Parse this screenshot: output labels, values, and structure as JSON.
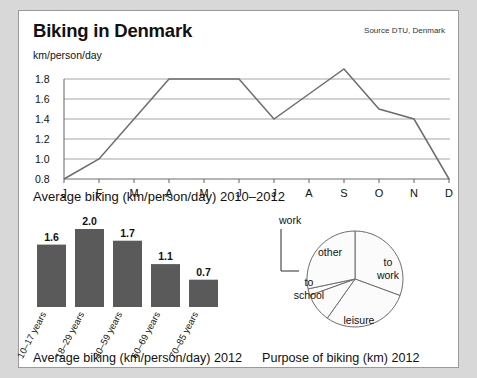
{
  "header": {
    "title": "Biking in Denmark",
    "source": "Source DTU, Denmark"
  },
  "line_chart_caption": "Average biking (km/person/day) 2010–2012",
  "bar_chart_caption": "Average biking (km/person/day) 2012",
  "pie_chart_caption": "Purpose of biking (km) 2012",
  "chart_data": [
    {
      "type": "line",
      "title": "Biking in Denmark",
      "subtitle": "Average biking (km/person/day) 2010–2012",
      "xlabel": "",
      "ylabel": "km/person/day",
      "ylim": [
        0.8,
        1.9
      ],
      "yticks": [
        "0.8",
        "1.0",
        "1.2",
        "1.4",
        "1.6",
        "1.8"
      ],
      "ytick_values": [
        0.8,
        1.0,
        1.2,
        1.4,
        1.6,
        1.8
      ],
      "grid": true,
      "legend": "none",
      "categories": [
        "J",
        "F",
        "M",
        "A",
        "M",
        "J",
        "J",
        "A",
        "S",
        "O",
        "N",
        "D"
      ],
      "values": [
        0.8,
        1.0,
        1.4,
        1.8,
        1.8,
        1.8,
        1.4,
        1.65,
        1.9,
        1.5,
        1.4,
        0.8
      ]
    },
    {
      "type": "bar",
      "title": "Average biking (km/person/day) 2012",
      "xlabel": "",
      "ylabel": "",
      "ylim": [
        0,
        2.0
      ],
      "grid": false,
      "legend": "none",
      "categories": [
        "10–17 years",
        "18–29 years",
        "30–59 years",
        "60–69 years",
        "70–85 years"
      ],
      "values": [
        1.6,
        2.0,
        1.7,
        1.1,
        0.7
      ],
      "value_labels": [
        "1.6",
        "2.0",
        "1.7",
        "1.1",
        "0.7"
      ]
    },
    {
      "type": "pie",
      "title": "Purpose of biking (km) 2012",
      "legend": "inline-labels",
      "labels": [
        "to work",
        "leisure",
        "to school",
        "work",
        "other"
      ],
      "values": [
        30.6,
        29.2,
        9.7,
        2.2,
        28.3
      ],
      "start_angle_deg": 0,
      "direction": "clockwise"
    }
  ]
}
